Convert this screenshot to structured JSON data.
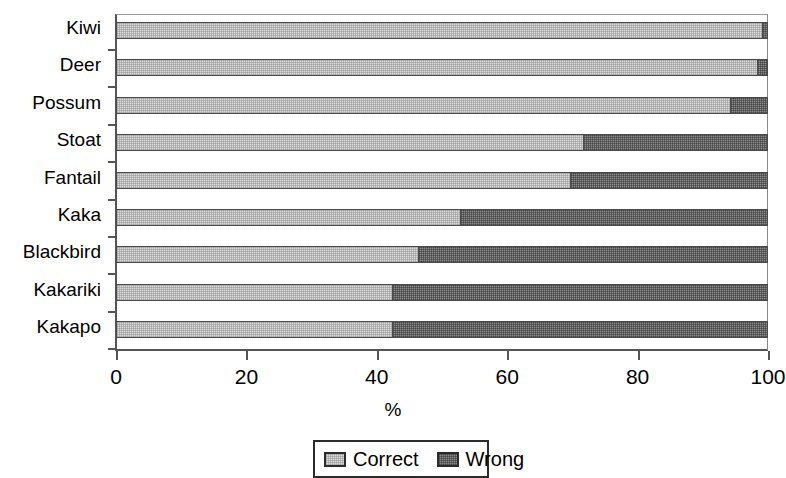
{
  "chart_data": {
    "type": "bar",
    "orientation": "horizontal",
    "stacked": true,
    "stack_total": 100,
    "title": "",
    "xlabel": "%",
    "ylabel": "",
    "xlim": [
      0,
      100
    ],
    "xticks": [
      0,
      20,
      40,
      60,
      80,
      100
    ],
    "xtick_labels": [
      "0",
      "20",
      "40",
      "60",
      "80",
      "100"
    ],
    "grid": false,
    "legend_position": "bottom-center",
    "categories": [
      "Kiwi",
      "Deer",
      "Possum",
      "Stoat",
      "Fantail",
      "Kaka",
      "Blackbird",
      "Kakariki",
      "Kakapo"
    ],
    "series": [
      {
        "name": "Correct",
        "color": "#dcdcdc",
        "values": [
          99.3,
          98.5,
          94.3,
          71.8,
          69.8,
          52.9,
          46.5,
          42.5,
          42.5
        ]
      },
      {
        "name": "Wrong",
        "color": "#8d8d8d",
        "values": [
          0.7,
          1.5,
          5.7,
          28.2,
          30.2,
          47.1,
          53.5,
          57.5,
          57.5
        ]
      }
    ]
  },
  "legend": {
    "items": [
      {
        "label": "Correct",
        "swatch": "correct"
      },
      {
        "label": "Wrong",
        "swatch": "wrong"
      }
    ]
  },
  "axis": {
    "x_title": "%"
  }
}
